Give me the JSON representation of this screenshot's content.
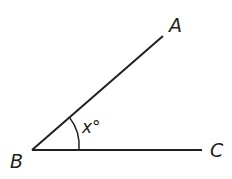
{
  "diagram": {
    "type": "angle",
    "stroke_color": "#231f20",
    "background": "#ffffff",
    "points": {
      "A": {
        "label": "A",
        "x": 163,
        "y": 36
      },
      "B": {
        "label": "B",
        "x": 32,
        "y": 150
      },
      "C": {
        "label": "C",
        "x": 202,
        "y": 150
      }
    },
    "segments": [
      {
        "from": "B",
        "to": "A"
      },
      {
        "from": "B",
        "to": "C"
      }
    ],
    "angle": {
      "vertex": "B",
      "label": "x°",
      "arc_radius": 47
    }
  }
}
